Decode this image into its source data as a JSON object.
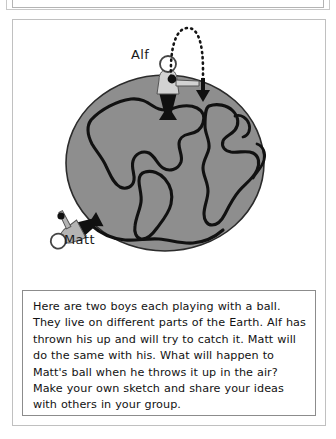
{
  "page": {
    "background_color": "#ffffff",
    "panel_border_color": "#c0c0c0",
    "prompt_border_color": "#8c8c8c"
  },
  "illustration": {
    "title": "two-boys-on-earth-diagram",
    "earth": {
      "label": "Earth globe",
      "fill_color": "#8e8e8e",
      "outline_color": "#2a2a2a",
      "continent_outline_color": "#111111"
    },
    "figures": [
      {
        "name": "alf",
        "label": "Alf",
        "position": "top of globe, standing upright",
        "head_color": "#ffffff",
        "body_color": "#d2d2d2",
        "legs_color": "#101010"
      },
      {
        "name": "matt",
        "label": "Matt",
        "position": "lower-left of globe, standing sideways",
        "head_color": "#ffffff",
        "body_color": "#b4b4b4",
        "legs_color": "#101010"
      }
    ],
    "ball_trajectory": {
      "name": "dotted-arc",
      "style": "dotted",
      "color": "#151515",
      "description": "ball thrown up and arcing over"
    },
    "ball": {
      "name": "ball-marker",
      "color": "#101010"
    },
    "fall_arrow": {
      "name": "downward-arrow",
      "color": "#101010",
      "direction": "down"
    }
  },
  "prompt": {
    "text": "Here are two boys each playing with a ball. They live on different parts of the Earth. Alf has thrown his up and will try to catch it. Matt will do the same with his. What will happen to Matt's ball when he throws it up in the air? Make your own sketch and share your ideas with others in your group."
  }
}
